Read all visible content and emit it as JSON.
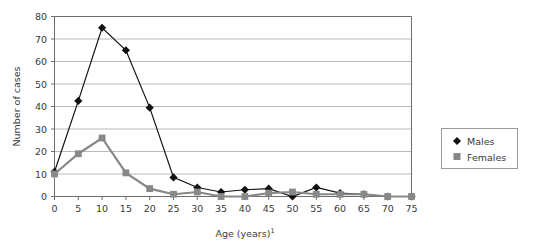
{
  "chart_data": {
    "type": "line",
    "title": "",
    "subtitle": "",
    "xlabel": "Age (years)",
    "xlabel_superscript": "1",
    "ylabel": "Number of cases",
    "x": [
      0,
      5,
      10,
      15,
      20,
      25,
      30,
      35,
      40,
      45,
      50,
      55,
      60,
      65,
      70,
      75
    ],
    "xtick_labels": [
      "0",
      "5",
      "10",
      "15",
      "20",
      "25",
      "30",
      "35",
      "40",
      "45",
      "50",
      "55",
      "60",
      "65",
      "70",
      "75"
    ],
    "ytick_labels": [
      "0",
      "10",
      "20",
      "30",
      "40",
      "50",
      "60",
      "70",
      "80"
    ],
    "yticks": [
      0,
      10,
      20,
      30,
      40,
      50,
      60,
      70,
      80
    ],
    "xlim": [
      0,
      75
    ],
    "ylim": [
      0,
      80
    ],
    "grid": "horizontal",
    "legend_position": "right",
    "series": [
      {
        "name": "Males",
        "marker": "diamond",
        "color": "#111111",
        "values": [
          11,
          42.5,
          75,
          65,
          39.5,
          8.5,
          4,
          2,
          3,
          3.5,
          0,
          4,
          1.5,
          1,
          0,
          0
        ]
      },
      {
        "name": "Females",
        "marker": "square",
        "color": "#888888",
        "values": [
          10,
          19,
          26,
          10.5,
          3.5,
          1,
          2,
          0,
          0,
          1.5,
          2,
          1,
          1,
          1,
          0,
          0
        ]
      }
    ]
  },
  "legend": {
    "items": [
      {
        "label": "Males",
        "marker": "diamond-marker",
        "color": "#111111"
      },
      {
        "label": "Females",
        "marker": "square-marker",
        "color": "#888888"
      }
    ]
  },
  "colors": {
    "males": "#111111",
    "females": "#888888",
    "grid": "#b9b9b9",
    "frame": "#6e6e6e",
    "text": "#3a3a3a"
  }
}
